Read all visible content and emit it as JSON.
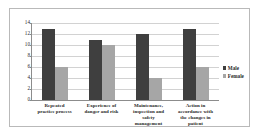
{
  "chart_data": {
    "type": "bar",
    "title": "",
    "subtitle": "",
    "xlabel": "",
    "ylabel": "",
    "ylim": [
      0,
      14
    ],
    "yticks": [
      0,
      2,
      4,
      6,
      8,
      10,
      12,
      14
    ],
    "grid": true,
    "legend_position": "right",
    "categories": [
      "Repeated practice process",
      "Experience of danger and risk",
      "Maintenance, inspection and safety management",
      "Action in accordance with the changes in patient"
    ],
    "series": [
      {
        "name": "Male",
        "color": "#3f3f3f",
        "values": [
          13,
          11,
          12,
          13
        ]
      },
      {
        "name": "Female",
        "color": "#a6a6a6",
        "values": [
          6,
          10,
          4,
          6
        ]
      }
    ]
  },
  "axis": {
    "y_tick_labels": [
      "14",
      "12",
      "10",
      "8",
      "6",
      "4",
      "2",
      "0"
    ]
  },
  "categories_display": [
    {
      "line1": "Repeated",
      "line2": "practice process",
      "line3": "",
      "line4": ""
    },
    {
      "line1": "Experience of",
      "line2": "danger and risk",
      "line3": "",
      "line4": ""
    },
    {
      "line1": "Maintenance,",
      "line2": "inspection and",
      "line3": "safety",
      "line4": "management"
    },
    {
      "line1": "Action in",
      "line2": "accordance with",
      "line3": "the changes in",
      "line4": "patient"
    }
  ],
  "legend": {
    "items": [
      {
        "label": "Male",
        "color": "#3f3f3f"
      },
      {
        "label": "Female",
        "color": "#a6a6a6"
      }
    ]
  }
}
